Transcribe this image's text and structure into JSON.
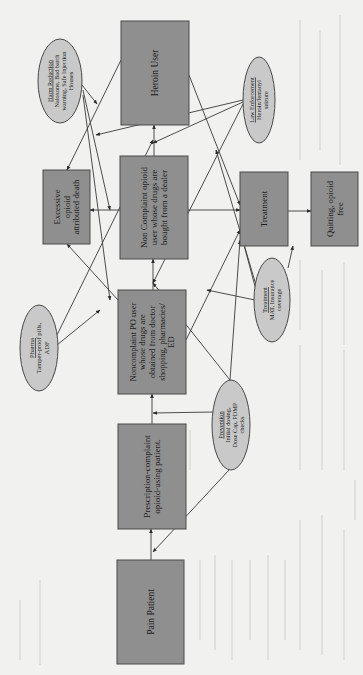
{
  "figure": {
    "orientation": "rotated 90 degrees counter-clockwise",
    "nodes": {
      "pain_patient": {
        "label": [
          "Pain Patient"
        ],
        "kind": "box"
      },
      "prescription": {
        "label": [
          "Prescription-complaint",
          "opioid-using patient."
        ],
        "kind": "box"
      },
      "noncomplaint_po": {
        "label": [
          "Noncomplaint PO user",
          "whose drugs are",
          "obtained from doctor",
          "shopping, pharmacies/",
          "ED"
        ],
        "kind": "box"
      },
      "non_complaint_dealer": {
        "label": [
          "Non Complaint opioid",
          "user whose drugs are",
          "bought from a dealer"
        ],
        "kind": "box"
      },
      "heroin_user": {
        "label": [
          "Heroin User"
        ],
        "kind": "box"
      },
      "excessive_death": {
        "label": [
          "Excessive",
          "opioid",
          "attributed death"
        ],
        "kind": "box"
      },
      "treatment": {
        "label": [
          "Treatment"
        ],
        "kind": "box"
      },
      "quitting": {
        "label": [
          "Quitting, opioid",
          "free"
        ],
        "kind": "box"
      },
      "harm_reduction": {
        "title": "Harm Reduction",
        "label": [
          "Naloxone, Bad batch",
          "warning, Safe Injection",
          "Houses"
        ],
        "kind": "ellipse"
      },
      "law_enforcement": {
        "title": "Law Enforcement",
        "label": [
          "Heroin/fentanyl",
          "seizure"
        ],
        "kind": "ellipse"
      },
      "pharma": {
        "title": "Pharma",
        "label": [
          "Tamper-proof pills,",
          "ADF"
        ],
        "kind": "ellipse"
      },
      "treatment_policy": {
        "title": "Treatment",
        "label": [
          "MAT, Insurance",
          "coverage"
        ],
        "kind": "ellipse"
      },
      "prevention": {
        "title": "Prevention",
        "label": [
          "Initial dosing,",
          "Dose Cap, PDMP",
          "checks"
        ],
        "kind": "ellipse"
      }
    },
    "edges": [
      [
        "pain_patient",
        "prescription"
      ],
      [
        "prescription",
        "noncomplaint_po"
      ],
      [
        "noncomplaint_po",
        "non_complaint_dealer"
      ],
      [
        "non_complaint_dealer",
        "heroin_user"
      ],
      [
        "noncomplaint_po",
        "excessive_death"
      ],
      [
        "non_complaint_dealer",
        "excessive_death"
      ],
      [
        "heroin_user",
        "excessive_death"
      ],
      [
        "noncomplaint_po",
        "treatment"
      ],
      [
        "non_complaint_dealer",
        "treatment"
      ],
      [
        "heroin_user",
        "treatment"
      ],
      [
        "treatment",
        "quitting"
      ],
      [
        "harm_reduction",
        "excessive_death"
      ],
      [
        "harm_reduction",
        "non_complaint_dealer"
      ],
      [
        "harm_reduction",
        "noncomplaint_po"
      ],
      [
        "law_enforcement",
        "excessive_death"
      ],
      [
        "law_enforcement",
        "non_complaint_dealer"
      ],
      [
        "law_enforcement",
        "noncomplaint_po"
      ],
      [
        "pharma",
        "non_complaint_dealer"
      ],
      [
        "pharma",
        "noncomplaint_po"
      ],
      [
        "treatment_policy",
        "treatment"
      ],
      [
        "treatment_policy",
        "quitting"
      ],
      [
        "treatment_policy",
        "noncomplaint_po"
      ],
      [
        "treatment_policy",
        "heroin_user"
      ],
      [
        "prevention",
        "prescription"
      ],
      [
        "prevention",
        "pain_patient"
      ],
      [
        "prevention",
        "non_complaint_dealer"
      ],
      [
        "prevention",
        "treatment"
      ]
    ]
  },
  "colors": {
    "box_fill": "#8f8f8f",
    "ellipse_fill": "#c9c9c9",
    "background": "#f1f1ef",
    "line": "#3a3a3a"
  }
}
